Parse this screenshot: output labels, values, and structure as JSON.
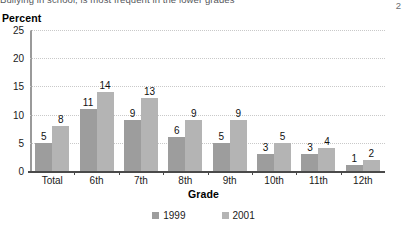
{
  "caption": {
    "text": "Bullying in school, is most frequent in the lower grades",
    "page_number": "2"
  },
  "chart_data": {
    "type": "bar",
    "title": "",
    "xlabel": "Grade",
    "ylabel": "Percent",
    "categories": [
      "Total",
      "6th",
      "7th",
      "8th",
      "9th",
      "10th",
      "11th",
      "12th"
    ],
    "series": [
      {
        "name": "1999",
        "color": "#9d9d9d",
        "values": [
          5,
          11,
          9,
          6,
          5,
          3,
          3,
          1
        ]
      },
      {
        "name": "2001",
        "color": "#b4b4b4",
        "values": [
          8,
          14,
          13,
          9,
          9,
          5,
          4,
          2
        ]
      }
    ],
    "ylim": [
      0,
      25
    ],
    "yticks": [
      0,
      5,
      10,
      15,
      20,
      25
    ],
    "grid": true,
    "legend_position": "bottom"
  }
}
